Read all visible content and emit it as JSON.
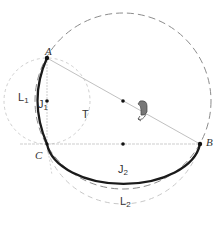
{
  "diagram": {
    "labels": {
      "A": "A",
      "B": "B",
      "C": "C",
      "T": "T",
      "L1_main": "L",
      "L1_sub": "1",
      "J1_main": "J",
      "J1_sub": "1",
      "J2_main": "J",
      "J2_sub": "2",
      "L2_main": "L",
      "L2_sub": "2"
    },
    "colors": {
      "bold_arc": "#1a1a1a",
      "thin_line": "#b0b0b0",
      "dashed_circle": "#8c8c8c",
      "faint_circle": "#c8c8c8",
      "rotation_arrow": "#555555",
      "point": "#111111"
    },
    "points": {
      "A": [
        47,
        58
      ],
      "B": [
        200,
        144
      ],
      "C": [
        47,
        144
      ],
      "M_AB": [
        123,
        101
      ],
      "J1": [
        47,
        101
      ],
      "J2": [
        123,
        144
      ]
    }
  }
}
